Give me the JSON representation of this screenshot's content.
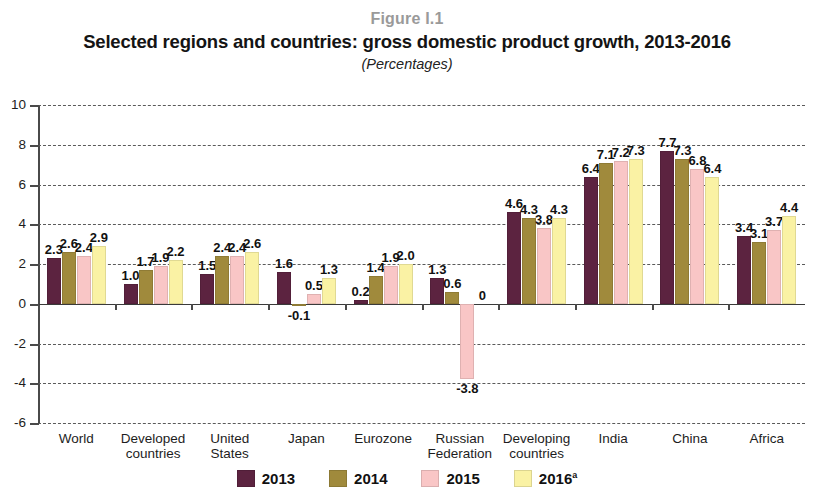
{
  "header": {
    "figure_number": "Figure I.1",
    "title": "Selected regions and countries: gross domestic product growth, 2013-2016",
    "subtitle": "(Percentages)"
  },
  "legend": {
    "items": [
      {
        "label": "2013",
        "color": "#5C2340",
        "superscript": ""
      },
      {
        "label": "2014",
        "color": "#A08A3C",
        "superscript": ""
      },
      {
        "label": "2015",
        "color": "#F9C6C6",
        "superscript": ""
      },
      {
        "label": "2016",
        "color": "#FAF2A4",
        "superscript": "a"
      }
    ]
  },
  "axis": {
    "y_ticks": [
      "10",
      "8",
      "6",
      "4",
      "2",
      "0",
      "-2",
      "-4",
      "-6"
    ],
    "y_min": -6,
    "y_max": 10
  },
  "chart_data": {
    "type": "bar",
    "title": "Selected regions and countries: gross domestic product growth, 2013-2016",
    "subtitle": "(Percentages)",
    "xlabel": "",
    "ylabel": "Percentages",
    "ylim": [
      -6,
      10
    ],
    "ytick_step": 2,
    "grid": true,
    "legend_position": "bottom",
    "categories": [
      "World",
      "Developed countries",
      "United States",
      "Japan",
      "Eurozone",
      "Russian Federation",
      "Developing countries",
      "India",
      "China",
      "Africa"
    ],
    "category_lines": [
      [
        "World"
      ],
      [
        "Developed",
        "countries"
      ],
      [
        "United",
        "States"
      ],
      [
        "Japan"
      ],
      [
        "Eurozone"
      ],
      [
        "Russian",
        "Federation"
      ],
      [
        "Developing",
        "countries"
      ],
      [
        "India"
      ],
      [
        "China"
      ],
      [
        "Africa"
      ]
    ],
    "series": [
      {
        "name": "2013",
        "color": "#5C2340",
        "values": [
          2.3,
          1.0,
          1.5,
          1.6,
          0.2,
          1.3,
          4.6,
          6.4,
          7.7,
          3.4
        ],
        "labels": [
          "2.3",
          "1.0",
          "1.5",
          "1.6",
          "0.2",
          "1.3",
          "4.6",
          "6.4",
          "7.7",
          "3.4"
        ]
      },
      {
        "name": "2014",
        "color": "#A08A3C",
        "values": [
          2.6,
          1.7,
          2.4,
          -0.1,
          1.4,
          0.6,
          4.3,
          7.1,
          7.3,
          3.1
        ],
        "labels": [
          "2.6",
          "1.7",
          "2.4",
          "-0.1",
          "1.4",
          "0.6",
          "4.3",
          "7.1",
          "7.3",
          "3.1"
        ]
      },
      {
        "name": "2015",
        "color": "#F9C6C6",
        "values": [
          2.4,
          1.9,
          2.4,
          0.5,
          1.9,
          -3.8,
          3.8,
          7.2,
          6.8,
          3.7
        ],
        "labels": [
          "2.4",
          "1.9",
          "2.4",
          "0.5",
          "1.9",
          "-3.8",
          "3.8",
          "7.2",
          "6.8",
          "3.7"
        ]
      },
      {
        "name": "2016",
        "color": "#FAF2A4",
        "values": [
          2.9,
          2.2,
          2.6,
          1.3,
          2.0,
          0.0,
          4.3,
          7.3,
          6.4,
          4.4
        ],
        "labels": [
          "2.9",
          "2.2",
          "2.6",
          "1.3",
          "2.0",
          "0",
          "4.3",
          "7.3",
          "6.4",
          "4.4"
        ]
      }
    ]
  }
}
